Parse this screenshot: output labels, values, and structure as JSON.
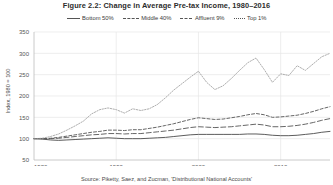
{
  "figure": {
    "title": "Figure 2.2: Change in Average Pre-tax Income, 1980–2016",
    "source": "Source: Piketty, Saez, and Zucman, 'Distributional National Accounts'",
    "ylabel": "Index, 1980 = 100"
  },
  "legend": {
    "items": [
      {
        "label": "Bottom 50%",
        "style": "solid",
        "color": "#4a4a4a"
      },
      {
        "label": "Middle 40%",
        "style": "longdash",
        "color": "#555555"
      },
      {
        "label": "Affluent 9%",
        "style": "dash",
        "color": "#555555"
      },
      {
        "label": "Top 1%",
        "style": "dot",
        "color": "#8a8a8a"
      }
    ]
  },
  "chart_data": {
    "type": "line",
    "title": "Figure 2.2: Change in Average Pre-tax Income, 1980–2016",
    "xlabel": "",
    "ylabel": "Index, 1980 = 100",
    "xlim": [
      1980,
      2016
    ],
    "ylim": [
      50,
      350
    ],
    "xticks": [
      1980,
      1990,
      2000,
      2010
    ],
    "yticks": [
      50,
      100,
      150,
      200,
      250,
      300,
      350
    ],
    "grid": true,
    "legend_position": "top",
    "x": [
      1980,
      1981,
      1982,
      1983,
      1984,
      1985,
      1986,
      1987,
      1988,
      1989,
      1990,
      1991,
      1992,
      1993,
      1994,
      1995,
      1996,
      1997,
      1998,
      1999,
      2000,
      2001,
      2002,
      2003,
      2004,
      2005,
      2006,
      2007,
      2008,
      2009,
      2010,
      2011,
      2012,
      2013,
      2014,
      2015,
      2016
    ],
    "series": [
      {
        "name": "Bottom 50%",
        "style": "solid",
        "color": "#4a4a4a",
        "values": [
          100,
          99,
          97,
          96,
          97,
          98,
          99,
          100,
          101,
          102,
          101,
          100,
          100,
          100,
          101,
          102,
          103,
          105,
          107,
          109,
          110,
          110,
          110,
          110,
          110,
          110,
          111,
          111,
          110,
          108,
          107,
          107,
          108,
          110,
          112,
          115,
          117
        ]
      },
      {
        "name": "Middle 40%",
        "style": "longdash",
        "color": "#555555",
        "values": [
          100,
          100,
          100,
          101,
          103,
          105,
          107,
          109,
          110,
          112,
          112,
          111,
          112,
          112,
          114,
          116,
          118,
          120,
          123,
          126,
          128,
          127,
          126,
          127,
          128,
          130,
          132,
          134,
          132,
          128,
          128,
          129,
          131,
          134,
          138,
          143,
          147
        ]
      },
      {
        "name": "Affluent 9%",
        "style": "dash",
        "color": "#555555",
        "values": [
          100,
          100,
          101,
          103,
          106,
          109,
          112,
          115,
          117,
          120,
          120,
          119,
          121,
          121,
          124,
          127,
          131,
          135,
          140,
          145,
          149,
          147,
          145,
          146,
          149,
          152,
          156,
          159,
          156,
          150,
          151,
          153,
          155,
          159,
          164,
          170,
          175
        ]
      },
      {
        "name": "Top 1%",
        "style": "dot",
        "color": "#999999",
        "values": [
          100,
          101,
          105,
          111,
          120,
          130,
          141,
          158,
          168,
          172,
          168,
          160,
          170,
          166,
          170,
          180,
          196,
          214,
          229,
          244,
          258,
          232,
          215,
          224,
          241,
          260,
          278,
          289,
          262,
          232,
          252,
          248,
          271,
          260,
          276,
          292,
          300
        ]
      }
    ]
  }
}
